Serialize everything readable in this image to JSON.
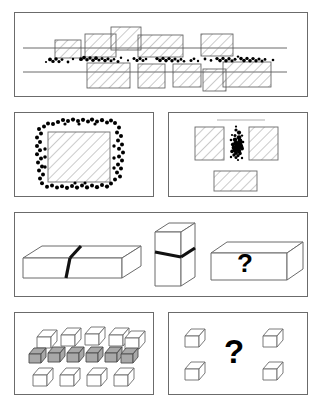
{
  "figure": {
    "background": "#ffffff",
    "stroke": "#6b6b6b",
    "ink": "#000000",
    "hatch_color": "#8c8c8c",
    "gray_fill": "#a8a8a8",
    "width": 322,
    "height": 410
  },
  "panels": [
    {
      "id": "panel-a",
      "name": "road-blocks-dots",
      "row": 1,
      "label": "",
      "description": "Two long horizontal lines with hatched rectangles above and below, dense black dot band between them",
      "x": 14,
      "y": 12,
      "w": 294,
      "h": 85,
      "lines": [
        {
          "name": "upper-road-line",
          "x1": 22,
          "y1": 47,
          "x2": 286,
          "y2": 47
        },
        {
          "name": "lower-road-line",
          "x1": 22,
          "y1": 71,
          "x2": 286,
          "y2": 71
        }
      ],
      "rects_top": [
        {
          "x": 54,
          "y": 39,
          "w": 26,
          "h": 18
        },
        {
          "x": 84,
          "y": 33,
          "w": 31,
          "h": 23
        },
        {
          "x": 110,
          "y": 26,
          "w": 30,
          "h": 23
        },
        {
          "x": 137,
          "y": 34,
          "w": 45,
          "h": 22
        },
        {
          "x": 200,
          "y": 33,
          "w": 32,
          "h": 22
        }
      ],
      "rects_bottom": [
        {
          "x": 86,
          "y": 62,
          "w": 43,
          "h": 25
        },
        {
          "x": 137,
          "y": 63,
          "w": 27,
          "h": 24
        },
        {
          "x": 172,
          "y": 63,
          "w": 28,
          "h": 23
        },
        {
          "x": 202,
          "y": 68,
          "w": 23,
          "h": 22
        },
        {
          "x": 222,
          "y": 61,
          "w": 48,
          "h": 25
        }
      ],
      "dot_band": {
        "y_center": 60,
        "x_from": 44,
        "x_to": 276,
        "count": 95
      }
    },
    {
      "id": "panel-b",
      "name": "dots-ring-around-square",
      "row": 2,
      "description": "Hatched square surrounded by ring of black dots",
      "x": 14,
      "y": 112,
      "w": 140,
      "h": 85,
      "square": {
        "x": 47,
        "y": 131,
        "w": 62,
        "h": 50
      },
      "dot_ring_count": 78
    },
    {
      "id": "panel-c",
      "name": "dots-cluster-between-rectangles",
      "row": 2,
      "description": "Three hatched rectangles with a compact dot cluster in the gap",
      "x": 168,
      "y": 112,
      "w": 140,
      "h": 85,
      "top_line": {
        "x1": 216,
        "y1": 120,
        "x2": 264,
        "y2": 120
      },
      "rects": [
        {
          "name": "left-rect",
          "x": 194,
          "y": 126,
          "w": 29,
          "h": 33
        },
        {
          "name": "right-rect",
          "x": 248,
          "y": 126,
          "w": 29,
          "h": 33
        },
        {
          "name": "bottom-rect",
          "x": 213,
          "y": 170,
          "w": 43,
          "h": 20
        }
      ],
      "cluster": {
        "cx": 236,
        "cy": 145,
        "count": 30
      }
    },
    {
      "id": "panel-d",
      "name": "split-bar-cube-question-bar",
      "row": 3,
      "description": "Long 3D bar with dark split, tall 3D block with dark split, and a 3D bar containing a question mark",
      "x": 14,
      "y": 212,
      "w": 294,
      "h": 85,
      "objects": [
        {
          "name": "long-split-bar",
          "type": "3d-bar"
        },
        {
          "name": "tall-split-block",
          "type": "3d-block"
        },
        {
          "name": "question-bar",
          "type": "3d-bar",
          "label": "?"
        }
      ],
      "question_label": "?"
    },
    {
      "id": "panel-e",
      "name": "house-array-gray-row",
      "row": 4,
      "description": "Array of 3D houses in three rows; middle row shaded gray",
      "x": 14,
      "y": 312,
      "w": 140,
      "h": 83,
      "rows": [
        {
          "name": "top-row",
          "count": 5,
          "fill": "white"
        },
        {
          "name": "middle-row",
          "count": 6,
          "fill": "gray"
        },
        {
          "name": "bottom-row",
          "count": 4,
          "fill": "white"
        }
      ]
    },
    {
      "id": "panel-f",
      "name": "four-houses-question",
      "row": 4,
      "description": "Four 3D houses at corners with a question mark in the center",
      "x": 168,
      "y": 312,
      "w": 140,
      "h": 83,
      "house_count": 4,
      "question_label": "?"
    }
  ],
  "labels": {
    "question_mark": "?"
  }
}
